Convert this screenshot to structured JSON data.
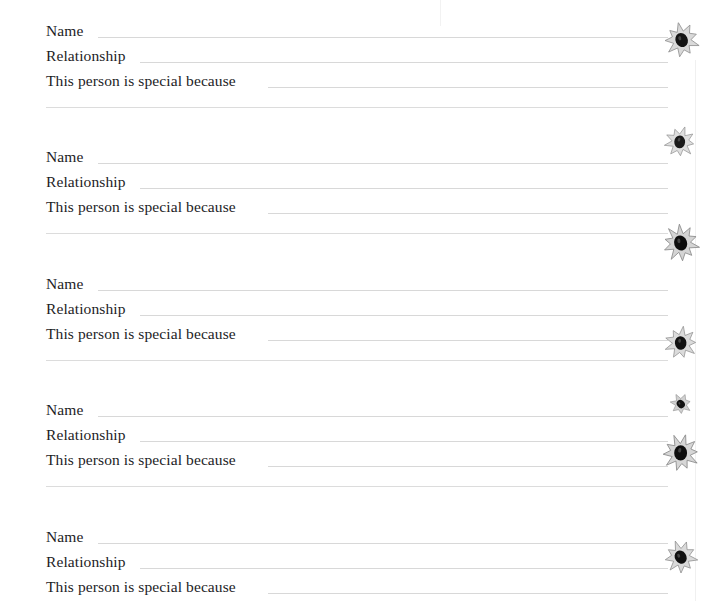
{
  "page": {
    "kind": "memory-book-fill-in-page",
    "width": 714,
    "height": 601,
    "background_color": "#ffffff",
    "rule_color": "#d8d8d8",
    "text_color": "#1d1d1f"
  },
  "labels": {
    "name": "Name",
    "relationship": "Relationship",
    "special_because": "This person is special because"
  },
  "entries": [
    {
      "index": 1,
      "top": 18,
      "fields": [
        {
          "key": "name",
          "value": "",
          "rule_class": "rule-name"
        },
        {
          "key": "relationship",
          "value": "",
          "rule_class": "rule-rel"
        },
        {
          "key": "special_because",
          "value": "",
          "rule_class": "rule-special"
        }
      ],
      "has_divider": true,
      "divider_offset": 89
    },
    {
      "index": 2,
      "top": 144,
      "fields": [
        {
          "key": "name",
          "value": "",
          "rule_class": "rule-name"
        },
        {
          "key": "relationship",
          "value": "",
          "rule_class": "rule-rel"
        },
        {
          "key": "special_because",
          "value": "",
          "rule_class": "rule-special"
        }
      ],
      "has_divider": true,
      "divider_offset": 89
    },
    {
      "index": 3,
      "top": 271,
      "fields": [
        {
          "key": "name",
          "value": "",
          "rule_class": "rule-name"
        },
        {
          "key": "relationship",
          "value": "",
          "rule_class": "rule-rel"
        },
        {
          "key": "special_because",
          "value": "",
          "rule_class": "rule-special"
        }
      ],
      "has_divider": true,
      "divider_offset": 89
    },
    {
      "index": 4,
      "top": 397,
      "fields": [
        {
          "key": "name",
          "value": "",
          "rule_class": "rule-name"
        },
        {
          "key": "relationship",
          "value": "",
          "rule_class": "rule-rel"
        },
        {
          "key": "special_because",
          "value": "",
          "rule_class": "rule-special"
        }
      ],
      "has_divider": true,
      "divider_offset": 89
    },
    {
      "index": 5,
      "top": 524,
      "fields": [
        {
          "key": "name",
          "value": "",
          "rule_class": "rule-name"
        },
        {
          "key": "relationship",
          "value": "",
          "rule_class": "rule-rel"
        },
        {
          "key": "special_because",
          "value": "",
          "rule_class": "rule-special"
        }
      ],
      "has_divider": false,
      "divider_offset": 89
    }
  ],
  "decorations": [
    {
      "name": "flower-ornament-1",
      "left": 664,
      "top": 22,
      "size": 36,
      "rotate": -12,
      "petals": 9,
      "center_color": "#141414",
      "petal_color": "#d9d9d9",
      "outline_color": "#8a8a8a"
    },
    {
      "name": "flower-ornament-2",
      "left": 664,
      "top": 126,
      "size": 32,
      "rotate": 18,
      "petals": 9,
      "center_color": "#1a1a1a",
      "petal_color": "#dedede",
      "outline_color": "#909090"
    },
    {
      "name": "flower-ornament-3",
      "left": 662,
      "top": 224,
      "size": 38,
      "rotate": -5,
      "petals": 10,
      "center_color": "#0d0d0d",
      "petal_color": "#d4d4d4",
      "outline_color": "#848484"
    },
    {
      "name": "flower-ornament-4",
      "left": 664,
      "top": 326,
      "size": 34,
      "rotate": 8,
      "petals": 9,
      "center_color": "#121212",
      "petal_color": "#dbdbdb",
      "outline_color": "#8c8c8c"
    },
    {
      "name": "flower-ornament-5",
      "left": 670,
      "top": 393,
      "size": 22,
      "rotate": -28,
      "petals": 7,
      "center_color": "#101010",
      "petal_color": "#d0d0d0",
      "outline_color": "#7e7e7e"
    },
    {
      "name": "flower-ornament-6",
      "left": 662,
      "top": 434,
      "size": 38,
      "rotate": 14,
      "petals": 10,
      "center_color": "#0f0f0f",
      "petal_color": "#d6d6d6",
      "outline_color": "#868686"
    },
    {
      "name": "flower-ornament-7",
      "left": 664,
      "top": 540,
      "size": 34,
      "rotate": -20,
      "petals": 9,
      "center_color": "#111111",
      "petal_color": "#dadada",
      "outline_color": "#8b8b8b"
    }
  ]
}
